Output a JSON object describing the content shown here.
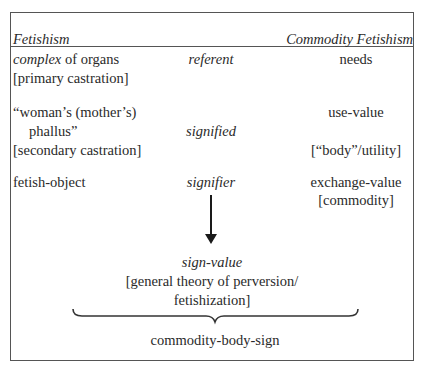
{
  "header": {
    "left_title": "Fetishism",
    "right_title": "Commodity Fetishism"
  },
  "rows": [
    {
      "left": {
        "italic_part": "complex",
        "rest": " of organs",
        "note": "[primary castration]"
      },
      "middle": "referent",
      "right": {
        "line1": "needs"
      }
    },
    {
      "left": {
        "line1": "“woman’s (mother’s)",
        "line2": "phallus”",
        "note": "[secondary castration]"
      },
      "middle": "signified",
      "right": {
        "line1": "use-value",
        "note": "[“body”/utility]"
      }
    },
    {
      "left": {
        "line1": "fetish-object"
      },
      "middle": "signifier",
      "right": {
        "line1": "exchange-value",
        "note": "[commodity]"
      }
    }
  ],
  "result": {
    "title": "sign-value",
    "line1": "[general theory of perversion/",
    "line2": "fetishization]"
  },
  "synthesis": "commodity-body-sign",
  "icons": {
    "arrow": "arrow-down-icon",
    "brace": "curly-brace-icon"
  },
  "colors": {
    "line": "#555555",
    "text": "#2a2a2a",
    "arrow": "#1a1a1a"
  }
}
